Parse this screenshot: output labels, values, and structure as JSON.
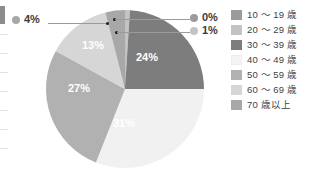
{
  "chart_data": {
    "type": "pie",
    "title": "",
    "subtitle": "",
    "xlabel": "",
    "ylabel": "",
    "grid": false,
    "legend_position": "right",
    "value_suffix": "%",
    "categories": [
      "10 〜 19 歳",
      "20 〜 29 歳",
      "30 〜 39 歳",
      "40 〜 49 歳",
      "50 〜 59 歳",
      "60 〜 69 歳",
      "70 歳以上"
    ],
    "values": [
      0,
      1,
      24,
      31,
      27,
      13,
      4
    ],
    "labels": [
      "0%",
      "1%",
      "24%",
      "31%",
      "27%",
      "13%",
      "4%"
    ],
    "colors": [
      "#9b9b9b",
      "#c3c3c3",
      "#7d7d7d",
      "#f1f1f1",
      "#b1b1b1",
      "#d6d6d6",
      "#a8a8a8"
    ],
    "inside_labels": [
      {
        "text": "24%",
        "x": 101,
        "y": 51
      },
      {
        "text": "31%",
        "x": 78,
        "y": 117
      },
      {
        "text": "27%",
        "x": 33,
        "y": 82
      },
      {
        "text": "13%",
        "x": 47,
        "y": 39
      }
    ],
    "callouts": [
      {
        "name": "callout-0",
        "text": "0%",
        "color": "#9b9b9b"
      },
      {
        "name": "callout-1",
        "text": "1%",
        "color": "#c3c3c3"
      },
      {
        "name": "callout-4",
        "text": "4%",
        "color": "#a8a8a8"
      }
    ]
  },
  "legend": {
    "items": [
      {
        "label": "10 〜 19 歳",
        "color": "#9b9b9b"
      },
      {
        "label": "20 〜 29 歳",
        "color": "#c3c3c3"
      },
      {
        "label": "30 〜 39 歳",
        "color": "#7d7d7d"
      },
      {
        "label": "40 〜 49 歳",
        "color": "#f4f4f4"
      },
      {
        "label": "50 〜 59 歳",
        "color": "#b1b1b1"
      },
      {
        "label": "60 〜 69 歳",
        "color": "#d6d6d6"
      },
      {
        "label": "70 歳以上",
        "color": "#a8a8a8"
      }
    ]
  }
}
